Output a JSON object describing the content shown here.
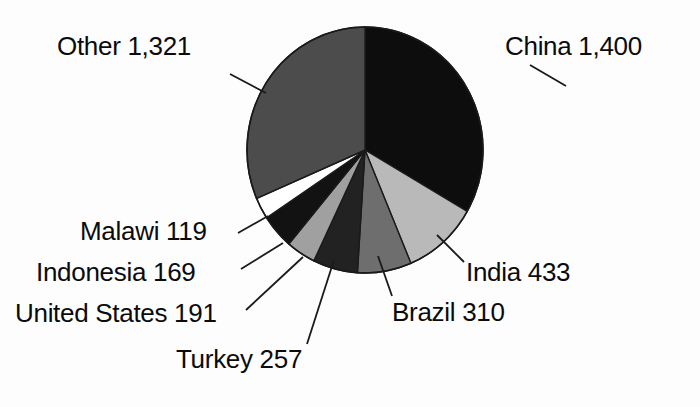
{
  "chart_data": {
    "type": "pie",
    "title": "",
    "xlabel": "",
    "ylabel": "",
    "total": 4200,
    "legend_position": "none",
    "grid": false,
    "labels_show_value": true,
    "categories": [
      "China",
      "India",
      "Brazil",
      "Turkey",
      "Indonesia",
      "United States",
      "Malawi",
      "Other"
    ],
    "values": [
      1400,
      433,
      310,
      257,
      169,
      191,
      119,
      1321
    ],
    "slices": [
      {
        "name": "China",
        "value": 1400,
        "value_text": "1,400",
        "label": "China 1,400",
        "color": "#0d0d0d",
        "percent": 33.3,
        "start_angle": 0,
        "end_angle": 120.0
      },
      {
        "name": "India",
        "value": 433,
        "value_text": "433",
        "label": "India 433",
        "color": "#b9b9b9",
        "percent": 10.3,
        "start_angle": 120.0,
        "end_angle": 157.1
      },
      {
        "name": "Brazil",
        "value": 310,
        "value_text": "310",
        "label": "Brazil 310",
        "color": "#6e6e6e",
        "percent": 7.4,
        "start_angle": 157.1,
        "end_angle": 183.7
      },
      {
        "name": "Turkey",
        "value": 257,
        "value_text": "257",
        "label": "Turkey 257",
        "color": "#222222",
        "percent": 6.1,
        "start_angle": 183.7,
        "end_angle": 205.7
      },
      {
        "name": "Indonesia",
        "value": 169,
        "value_text": "169",
        "label": "Indonesia 169",
        "color": "#a0a0a0",
        "percent": 4.0,
        "start_angle": 205.7,
        "end_angle": 220.2
      },
      {
        "name": "United States",
        "value": 191,
        "value_text": "191",
        "label": "United States 191",
        "color": "#121212",
        "percent": 4.5,
        "start_angle": 220.2,
        "end_angle": 236.6
      },
      {
        "name": "Malawi",
        "value": 119,
        "value_text": "119",
        "label": "Malawi 119",
        "color": "#ffffff",
        "percent": 2.8,
        "start_angle": 236.6,
        "end_angle": 246.8
      },
      {
        "name": "Other",
        "value": 1321,
        "value_text": "1,321",
        "label": "Other 1,321",
        "color": "#4c4c4c",
        "percent": 31.5,
        "start_angle": 246.8,
        "end_angle": 360.0
      }
    ]
  },
  "labels": {
    "other": "Other 1,321",
    "china": "China 1,400",
    "india": "India 433",
    "brazil": "Brazil 310",
    "turkey": "Turkey 257",
    "malawi": "Malawi 119",
    "indonesia": "Indonesia 169",
    "united_states": "United States 191"
  },
  "colors": {
    "background": "#fdfdfd",
    "outline": "#1a1a1a",
    "leader_line": "#1a1a1a",
    "text": "#0b0b0b"
  }
}
